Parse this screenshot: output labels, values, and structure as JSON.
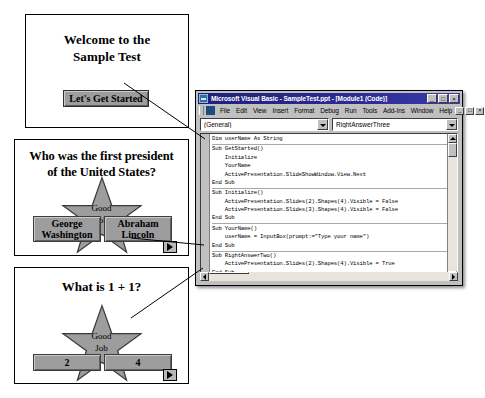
{
  "slides": [
    {
      "id": "slide-1",
      "title": "Welcome to the\nSample Test",
      "button_label": "Let's Get Started",
      "has_advance_button": false
    },
    {
      "id": "slide-2",
      "title": "Who was the first president\nof the United States?",
      "star_label": "Good\nJob",
      "answers": [
        "George\nWashington",
        "Abraham\nLincoln"
      ],
      "has_advance_button": true,
      "advance_icon": "play-triangle-icon"
    },
    {
      "id": "slide-3",
      "title": "What is 1 + 1?",
      "star_label": "Good\nJob",
      "answers": [
        "2",
        "4"
      ],
      "has_advance_button": true,
      "advance_icon": "play-triangle-icon"
    }
  ],
  "vbe": {
    "title": "Microsoft Visual Basic - SampleTest.ppt - [Module1 (Code)]",
    "app_icon": "visual-basic-icon",
    "window_buttons": [
      {
        "name": "minimize-button",
        "glyph": "_"
      },
      {
        "name": "maximize-button",
        "glyph": "□"
      },
      {
        "name": "close-button",
        "glyph": "×"
      }
    ],
    "mdi_buttons": [
      {
        "name": "mdi-minimize-button",
        "glyph": "_"
      },
      {
        "name": "mdi-restore-button",
        "glyph": "□"
      },
      {
        "name": "mdi-close-button",
        "glyph": "×"
      }
    ],
    "menu": [
      "File",
      "Edit",
      "View",
      "Insert",
      "Format",
      "Debug",
      "Run",
      "Tools",
      "Add-Ins",
      "Window",
      "Help"
    ],
    "combos": {
      "object_value": "(General)",
      "procedure_value": "RightAnswerThree"
    },
    "code_blocks": [
      {
        "lines": [
          "Dim userName As String"
        ]
      },
      {
        "lines": [
          "Sub GetStarted()",
          "    Initialize",
          "    YourName",
          "    ActivePresentation.SlideShowWindow.View.Next",
          "End Sub"
        ]
      },
      {
        "lines": [
          "Sub Initialize()",
          "    ActivePresentation.Slides(2).Shapes(4).Visible = False",
          "    ActivePresentation.Slides(3).Shapes(4).Visible = False",
          "End Sub"
        ]
      },
      {
        "lines": [
          "Sub YourName()",
          "    userName = InputBox(prompt:=\"Type your name\")",
          "End Sub"
        ]
      },
      {
        "lines": [
          "Sub RightAnswerTwo()",
          "    ActivePresentation.Slides(2).Shapes(4).Visible = True",
          "End Sub"
        ]
      },
      {
        "lines": [
          "Sub RightAnswerThree()",
          "    ActivePresentation.Slides(3).Shapes(4).Visible = True",
          "End Sub"
        ]
      }
    ],
    "scrollbars": {
      "v_up_icon": "scroll-up-arrow-icon",
      "v_down_icon": "scroll-down-arrow-icon",
      "h_left_icon": "scroll-left-arrow-icon",
      "h_right_icon": "scroll-right-arrow-icon"
    }
  },
  "colors": {
    "titlebar": "#20207a",
    "window_face": "#c0c0c0",
    "shape_fill": "#9d9d9d",
    "code_background": "#ffffff"
  }
}
